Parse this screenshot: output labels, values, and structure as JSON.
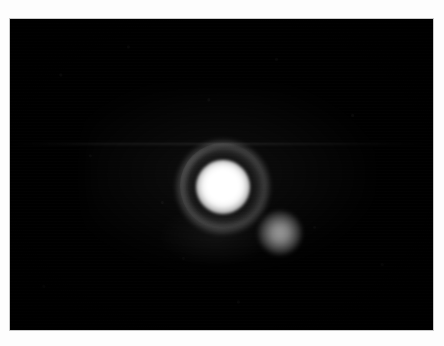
{
  "page": {
    "width": 444,
    "height": 346,
    "background_color": "#fdfdfd"
  },
  "frame": {
    "name": "image-frame",
    "x": 10,
    "y": 19,
    "width": 423,
    "height": 311,
    "background_color": "#000000",
    "border_color": "#c9c9c9"
  },
  "objects": {
    "primary": {
      "label": "primary-source",
      "center_x": 213,
      "center_y": 168,
      "core_radius": 16,
      "core_color": "#ffffff",
      "description": "Saturated bright point source"
    },
    "halo": {
      "label": "diffuse-ring",
      "center_x": 213,
      "center_y": 168,
      "inner_radius": 26,
      "outer_radius": 45,
      "color": "#6e6e6e",
      "description": "Faint circular ring surrounding the primary source"
    },
    "companion": {
      "label": "companion-source",
      "center_x": 270,
      "center_y": 214,
      "radius": 12,
      "color": "#8a8a8a",
      "description": "Fainter secondary blob lower-right of the primary"
    },
    "wisp": {
      "label": "faint-nebulosity",
      "center_x": 205,
      "center_y": 217,
      "color": "#1a1a1a",
      "description": "Very faint diffuse emission below the primary"
    },
    "scan_band": {
      "label": "horizontal-scan-band",
      "y": 143,
      "color": "#141414",
      "description": "Faint horizontal detector banding artifact"
    }
  },
  "background": {
    "label": "sky-background",
    "color": "#000000",
    "noise_color": "#ffffff",
    "description": "Dark sky field with low level detector noise"
  }
}
